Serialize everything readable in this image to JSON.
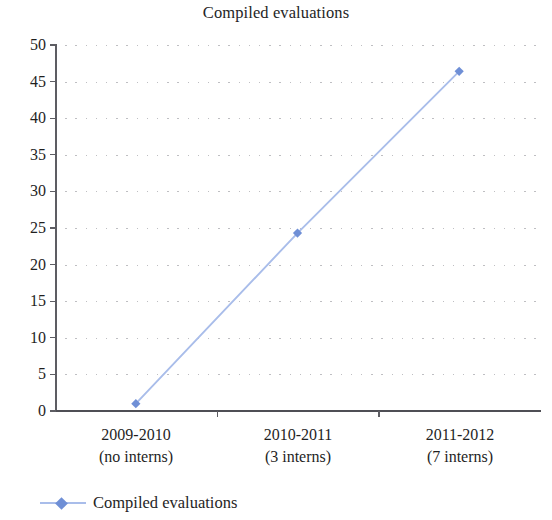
{
  "chart_data": {
    "type": "line",
    "title": "Compiled evaluations",
    "xlabel": "",
    "ylabel": "",
    "categories": [
      "2009-2010\n(no interns)",
      "2010-2011\n(3 interns)",
      "2011-2012\n(7 interns)"
    ],
    "category_lines": [
      {
        "line1": "2009-2010",
        "line2": "(no interns)"
      },
      {
        "line1": "2010-2011",
        "line2": "(3 interns)"
      },
      {
        "line1": "2011-2012",
        "line2": "(7 interns)"
      }
    ],
    "series": [
      {
        "name": "Compiled evaluations",
        "values": [
          1,
          24.3,
          46.4
        ]
      }
    ],
    "values": [
      1,
      24.3,
      46.4
    ],
    "ylim": [
      0,
      50
    ],
    "ytick_step": 5,
    "yticks": [
      0,
      5,
      10,
      15,
      20,
      25,
      30,
      35,
      40,
      45,
      50
    ],
    "ytick_labels": [
      "0",
      "5",
      "10",
      "15",
      "20",
      "25",
      "30",
      "35",
      "40",
      "45",
      "50"
    ],
    "grid": true,
    "grid_style": "dotted-horizontal",
    "legend_position": "bottom-left",
    "legend_entries": [
      "Compiled evaluations"
    ],
    "marker": "diamond",
    "colors": {
      "line": "#a9bdea",
      "marker": "#6f8fd6",
      "grid": "#b9b9bd",
      "axis": "#4f4f55",
      "text": "#1f1f1f"
    }
  },
  "legend": {
    "label": "Compiled evaluations"
  }
}
